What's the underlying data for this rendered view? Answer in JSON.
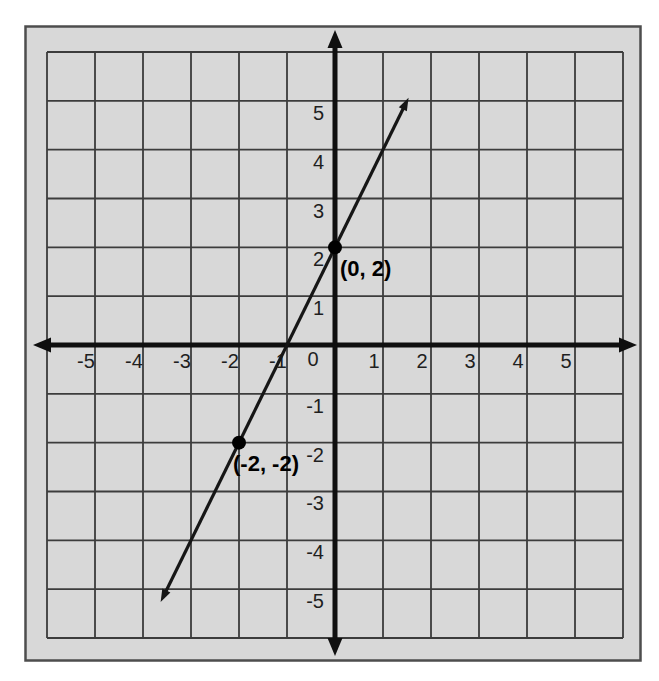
{
  "chart_data": {
    "type": "line",
    "title": "",
    "xlabel": "",
    "ylabel": "",
    "x_range": [
      -6,
      6
    ],
    "y_range": [
      -6,
      6
    ],
    "grid": true,
    "x_ticks": [
      -5,
      -4,
      -3,
      -2,
      -1,
      1,
      2,
      3,
      4,
      5
    ],
    "y_ticks": [
      5,
      4,
      3,
      2,
      1,
      -1,
      -2,
      -3,
      -4,
      -5
    ],
    "origin_label": "0",
    "line": {
      "slope": 2,
      "y_intercept": 2,
      "segment": {
        "x1": -3.55,
        "y1": -5.1,
        "x2": 1.45,
        "y2": 4.9
      }
    },
    "points": [
      {
        "x": 0,
        "y": 2,
        "label": "(0, 2)",
        "label_position": "below-right"
      },
      {
        "x": -2,
        "y": -2,
        "label": "(-2, -2)",
        "label_position": "below"
      }
    ],
    "colors": {
      "page_bg": "#ffffff",
      "panel_bg": "#d8d8d8",
      "panel_border": "#4d4d4d",
      "grid_line": "#3c3c3c",
      "axis": "#0f0f0f",
      "line": "#161616",
      "point": "#000000",
      "tick_text": "#1f1f1f",
      "point_label_text": "#000000"
    }
  }
}
